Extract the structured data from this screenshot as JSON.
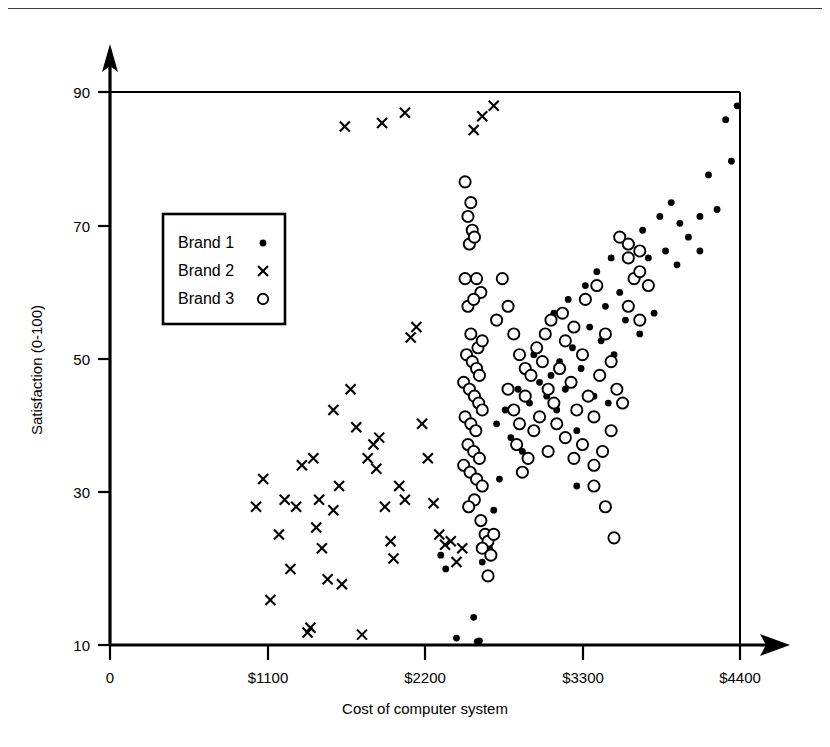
{
  "figure": {
    "background_color": "#ffffff",
    "ink_color": "#000000",
    "has_top_page_rule": true
  },
  "chart_data": {
    "type": "scatter",
    "title": "",
    "xlabel": "Cost of computer system",
    "ylabel": "Satisfaction (0-100)",
    "xlim": [
      0,
      4400
    ],
    "ylim": [
      10,
      90
    ],
    "xticks": [
      0,
      1100,
      2200,
      3300,
      4400
    ],
    "xticklabels": [
      "0",
      "$1100",
      "$2200",
      "$3300",
      "$4400"
    ],
    "yticks": [
      10,
      30,
      50,
      70,
      90
    ],
    "yticklabels": [
      "10",
      "30",
      "50",
      "70",
      "90"
    ],
    "grid": false,
    "legend_position": "upper-left-inside",
    "axis_arrows": true,
    "series": [
      {
        "name": "Brand 1",
        "marker": "filled-dot",
        "points": [
          [
            2310,
            23
          ],
          [
            2345,
            21
          ],
          [
            2420,
            11
          ],
          [
            2540,
            14
          ],
          [
            2565,
            10.5
          ],
          [
            2580,
            10.6
          ],
          [
            2600,
            22
          ],
          [
            2620,
            20
          ],
          [
            2650,
            24
          ],
          [
            2680,
            29.5
          ],
          [
            2700,
            42
          ],
          [
            2720,
            34
          ],
          [
            2760,
            44
          ],
          [
            2800,
            40
          ],
          [
            2850,
            47
          ],
          [
            2880,
            38
          ],
          [
            2900,
            50
          ],
          [
            2930,
            45
          ],
          [
            2960,
            52
          ],
          [
            2980,
            43
          ],
          [
            3000,
            48
          ],
          [
            3020,
            55
          ],
          [
            3050,
            46
          ],
          [
            3080,
            49
          ],
          [
            3100,
            58
          ],
          [
            3120,
            44
          ],
          [
            3140,
            51
          ],
          [
            3180,
            47
          ],
          [
            3200,
            60
          ],
          [
            3230,
            53
          ],
          [
            3260,
            41
          ],
          [
            3290,
            50
          ],
          [
            3320,
            62
          ],
          [
            3350,
            56
          ],
          [
            3380,
            46
          ],
          [
            3400,
            64
          ],
          [
            3430,
            54
          ],
          [
            3460,
            59
          ],
          [
            3500,
            66
          ],
          [
            3520,
            52
          ],
          [
            3560,
            61
          ],
          [
            3600,
            57
          ],
          [
            3640,
            68
          ],
          [
            3680,
            63
          ],
          [
            3720,
            70
          ],
          [
            3760,
            66
          ],
          [
            3800,
            58
          ],
          [
            3840,
            72
          ],
          [
            3880,
            67
          ],
          [
            3920,
            74
          ],
          [
            3980,
            71
          ],
          [
            4040,
            69
          ],
          [
            4120,
            72
          ],
          [
            4180,
            78
          ],
          [
            4240,
            73
          ],
          [
            4300,
            86
          ],
          [
            4380,
            88
          ],
          [
            4340,
            80
          ],
          [
            4120,
            67
          ],
          [
            3960,
            65
          ],
          [
            3700,
            55
          ],
          [
            3480,
            45
          ],
          [
            3260,
            33
          ]
        ]
      },
      {
        "name": "Brand 2",
        "marker": "cross",
        "points": [
          [
            1020,
            30
          ],
          [
            1070,
            34
          ],
          [
            1120,
            16.5
          ],
          [
            1180,
            26
          ],
          [
            1220,
            31
          ],
          [
            1260,
            21
          ],
          [
            1340,
            36
          ],
          [
            1380,
            11.8
          ],
          [
            1400,
            12.5
          ],
          [
            1420,
            37
          ],
          [
            1460,
            31
          ],
          [
            1480,
            24
          ],
          [
            1520,
            19.5
          ],
          [
            1560,
            29.5
          ],
          [
            1600,
            33
          ],
          [
            1620,
            18.8
          ],
          [
            1680,
            47
          ],
          [
            1720,
            41.5
          ],
          [
            1760,
            11.5
          ],
          [
            1800,
            37
          ],
          [
            1840,
            39
          ],
          [
            1860,
            35.5
          ],
          [
            1880,
            40
          ],
          [
            1920,
            30
          ],
          [
            1960,
            25
          ],
          [
            1980,
            22.5
          ],
          [
            2020,
            33
          ],
          [
            2060,
            31
          ],
          [
            2100,
            54.5
          ],
          [
            2140,
            56
          ],
          [
            2180,
            42
          ],
          [
            2220,
            37
          ],
          [
            2260,
            30.5
          ],
          [
            2300,
            26
          ],
          [
            2340,
            24.5
          ],
          [
            2380,
            25
          ],
          [
            2420,
            22
          ],
          [
            2460,
            24
          ],
          [
            1640,
            85
          ],
          [
            1900,
            85.5
          ],
          [
            2060,
            87
          ],
          [
            2540,
            84.5
          ],
          [
            2600,
            86.5
          ],
          [
            2680,
            88
          ],
          [
            1560,
            44
          ],
          [
            1300,
            30
          ],
          [
            1440,
            27
          ]
        ]
      },
      {
        "name": "Brand 3",
        "marker": "open-circle",
        "points": [
          [
            2480,
            77
          ],
          [
            2500,
            72
          ],
          [
            2520,
            74
          ],
          [
            2530,
            70
          ],
          [
            2510,
            68
          ],
          [
            2545,
            69
          ],
          [
            2480,
            63
          ],
          [
            2560,
            63
          ],
          [
            2590,
            61
          ],
          [
            2500,
            59
          ],
          [
            2540,
            60
          ],
          [
            2520,
            55
          ],
          [
            2570,
            53
          ],
          [
            2600,
            54
          ],
          [
            2490,
            52
          ],
          [
            2530,
            51
          ],
          [
            2560,
            50
          ],
          [
            2580,
            49
          ],
          [
            2470,
            48
          ],
          [
            2510,
            47
          ],
          [
            2545,
            46
          ],
          [
            2575,
            45
          ],
          [
            2600,
            44
          ],
          [
            2480,
            43
          ],
          [
            2520,
            42
          ],
          [
            2555,
            41
          ],
          [
            2500,
            39
          ],
          [
            2540,
            38
          ],
          [
            2580,
            37
          ],
          [
            2470,
            36
          ],
          [
            2515,
            35
          ],
          [
            2560,
            34
          ],
          [
            2600,
            33
          ],
          [
            2545,
            31
          ],
          [
            2505,
            30
          ],
          [
            2590,
            28
          ],
          [
            2620,
            26
          ],
          [
            2640,
            25
          ],
          [
            2600,
            24
          ],
          [
            2660,
            23
          ],
          [
            2640,
            20
          ],
          [
            2680,
            26
          ],
          [
            2700,
            57
          ],
          [
            2740,
            63
          ],
          [
            2780,
            59
          ],
          [
            2820,
            55
          ],
          [
            2860,
            52
          ],
          [
            2900,
            50
          ],
          [
            2780,
            47
          ],
          [
            2820,
            44
          ],
          [
            2860,
            42
          ],
          [
            2900,
            46
          ],
          [
            2940,
            49
          ],
          [
            2980,
            53
          ],
          [
            3020,
            51
          ],
          [
            3060,
            47
          ],
          [
            3100,
            45
          ],
          [
            3140,
            50
          ],
          [
            3180,
            54
          ],
          [
            3220,
            48
          ],
          [
            3260,
            44
          ],
          [
            3300,
            52
          ],
          [
            3340,
            46
          ],
          [
            3380,
            43
          ],
          [
            3420,
            49
          ],
          [
            3460,
            55
          ],
          [
            3500,
            51
          ],
          [
            3540,
            47
          ],
          [
            3580,
            45
          ],
          [
            3620,
            59
          ],
          [
            3660,
            63
          ],
          [
            3700,
            57
          ],
          [
            3560,
            69
          ],
          [
            3620,
            66
          ],
          [
            3700,
            64
          ],
          [
            3760,
            62
          ],
          [
            3500,
            41
          ],
          [
            3440,
            38
          ],
          [
            3380,
            36
          ],
          [
            3300,
            39
          ],
          [
            3240,
            37
          ],
          [
            3180,
            40
          ],
          [
            3120,
            42
          ],
          [
            3060,
            38
          ],
          [
            3460,
            30
          ],
          [
            3520,
            25.5
          ],
          [
            3380,
            33
          ],
          [
            2960,
            41
          ],
          [
            2920,
            37
          ],
          [
            2880,
            35
          ],
          [
            2840,
            39
          ],
          [
            3000,
            43
          ],
          [
            3040,
            55
          ],
          [
            3080,
            57
          ],
          [
            3160,
            58
          ],
          [
            3240,
            56
          ],
          [
            3320,
            60
          ],
          [
            3400,
            62
          ],
          [
            3620,
            68
          ],
          [
            3700,
            67
          ]
        ]
      }
    ]
  },
  "legend": {
    "entries": [
      {
        "label": "Brand 1",
        "marker": "filled-dot"
      },
      {
        "label": "Brand 2",
        "marker": "cross"
      },
      {
        "label": "Brand 3",
        "marker": "open-circle"
      }
    ]
  }
}
